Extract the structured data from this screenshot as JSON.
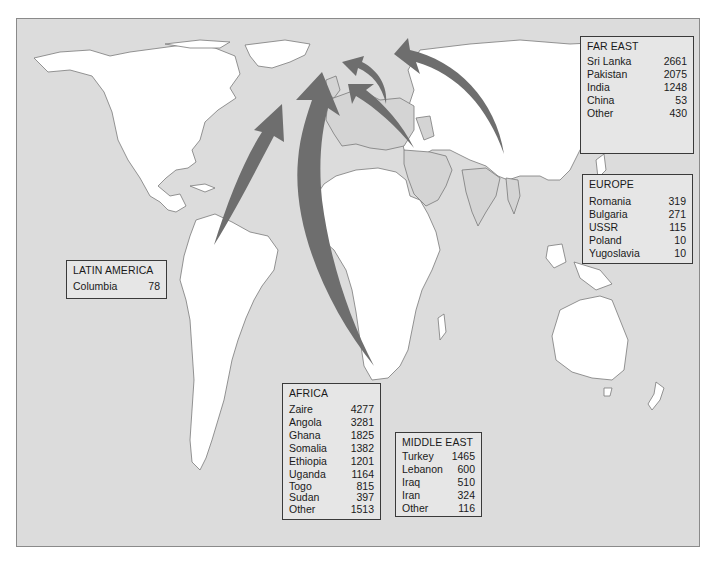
{
  "map": {
    "description": "World map showing refugee/asylum flows into Europe, with arrows from regions",
    "colors": {
      "ocean": "#dcdcdc",
      "land": "#ffffff",
      "europe_mideast_land": "#d4d4d4",
      "coastline": "#7a7a7a",
      "arrow": "#6e6e6e",
      "box_border": "#3a3a3a"
    }
  },
  "regions": {
    "far_east": {
      "title": "FAR EAST",
      "rows": [
        {
          "country": "Sri Lanka",
          "value": "2661"
        },
        {
          "country": "Pakistan",
          "value": "2075"
        },
        {
          "country": "India",
          "value": "1248"
        },
        {
          "country": "China",
          "value": "53"
        },
        {
          "country": "Other",
          "value": "430"
        }
      ]
    },
    "europe": {
      "title": "EUROPE",
      "rows": [
        {
          "country": "Romania",
          "value": "319"
        },
        {
          "country": "Bulgaria",
          "value": "271"
        },
        {
          "country": "USSR",
          "value": "115"
        },
        {
          "country": "Poland",
          "value": "10"
        },
        {
          "country": "Yugoslavia",
          "value": "10"
        }
      ]
    },
    "latin_america": {
      "title": "LATIN AMERICA",
      "rows": [
        {
          "country": "Columbia",
          "value": "78"
        }
      ]
    },
    "africa": {
      "title": "AFRICA",
      "rows": [
        {
          "country": "Zaire",
          "value": "4277"
        },
        {
          "country": "Angola",
          "value": "3281"
        },
        {
          "country": "Ghana",
          "value": "1825"
        },
        {
          "country": "Somalia",
          "value": "1382"
        },
        {
          "country": "Ethiopia",
          "value": "1201"
        },
        {
          "country": "Uganda",
          "value": "1164"
        },
        {
          "country": "Togo",
          "value": "815"
        },
        {
          "country": "Sudan",
          "value": "397"
        },
        {
          "country": "Other",
          "value": "1513"
        }
      ]
    },
    "middle_east": {
      "title": "MIDDLE EAST",
      "rows": [
        {
          "country": "Turkey",
          "value": "1465"
        },
        {
          "country": "Lebanon",
          "value": "600"
        },
        {
          "country": "Iraq",
          "value": "510"
        },
        {
          "country": "Iran",
          "value": "324"
        },
        {
          "country": "Other",
          "value": "116"
        }
      ]
    }
  }
}
